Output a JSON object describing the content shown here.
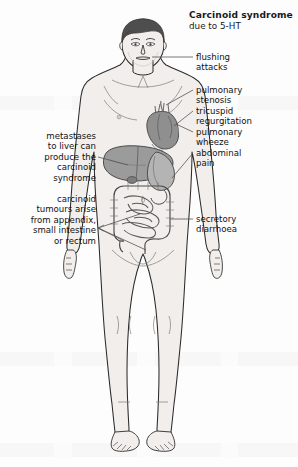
{
  "figure": {
    "title": "Carcinoid syndrome",
    "subtitle": "due to 5-HT"
  },
  "labels_right": [
    {
      "id": "flushing",
      "text": "flushing\nattacks",
      "line1": "flushing",
      "line2": "attacks"
    },
    {
      "id": "pulmonary-stenosis",
      "line1": "pulmonary",
      "line2": "stenosis"
    },
    {
      "id": "tricuspid-regurgitation",
      "line1": "tricuspid",
      "line2": "regurgitation"
    },
    {
      "id": "pulmonary-wheeze",
      "line1": "pulmonary",
      "line2": "wheeze"
    },
    {
      "id": "abdominal-pain",
      "line1": "abdominal",
      "line2": "pain"
    },
    {
      "id": "secretory-diarrhoea",
      "line1": "secretory",
      "line2": "diarrhoea"
    }
  ],
  "labels_left": [
    {
      "id": "liver-metastases",
      "line1": "metastases",
      "line2": "to liver can",
      "line3": "produce the",
      "line4": "carcinoid",
      "line5": "syndrome"
    },
    {
      "id": "tumour-origin",
      "line1": "carcinoid",
      "line2": "tumours arise",
      "line3": "from appendix,",
      "line4": "small intestine",
      "line5": "or rectum"
    }
  ],
  "organs": [
    {
      "name": "heart",
      "shade": "#8f8f8f"
    },
    {
      "name": "liver",
      "shade": "#9b9b9b"
    },
    {
      "name": "stomach",
      "shade": "#b4b4b4"
    },
    {
      "name": "large-intestine",
      "shade": "#c9c9c9"
    },
    {
      "name": "small-intestine",
      "shade": "#d6d6d6"
    },
    {
      "name": "appendix",
      "shade": "#c0c0c0"
    }
  ],
  "colors": {
    "background": "#fdfdfd",
    "skin": "#f2eeeb",
    "skin_shadow": "#e2dcd8",
    "hair": "#4e4e4e",
    "outline": "#2b2b2b",
    "leader_line": "#555555",
    "text": "#111111"
  }
}
